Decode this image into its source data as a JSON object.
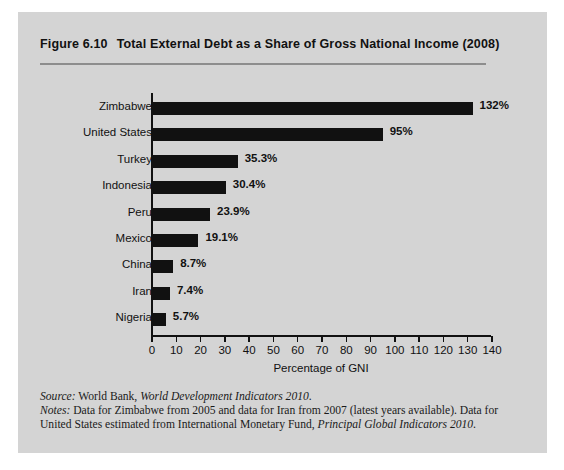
{
  "figure": {
    "number": "Figure 6.10",
    "title": "Total External Debt as a Share of Gross National Income (2008)"
  },
  "chart_data": {
    "type": "bar",
    "orientation": "horizontal",
    "title": "Total External Debt as a Share of Gross National Income (2008)",
    "categories": [
      "Zimbabwe",
      "United States",
      "Turkey",
      "Indonesia",
      "Peru",
      "Mexico",
      "China",
      "Iran",
      "Nigeria"
    ],
    "values": [
      132,
      95,
      35.3,
      30.4,
      23.9,
      19.1,
      8.7,
      7.4,
      5.7
    ],
    "value_labels": [
      "132%",
      "95%",
      "35.3%",
      "30.4%",
      "23.9%",
      "19.1%",
      "8.7%",
      "7.4%",
      "5.7%"
    ],
    "xlabel": "Percentage of GNI",
    "ylabel": "",
    "xlim": [
      0,
      140
    ],
    "xticks": [
      0,
      10,
      20,
      30,
      40,
      50,
      60,
      70,
      80,
      90,
      100,
      110,
      120,
      130,
      140
    ],
    "xtick_labels": [
      "0",
      "10",
      "20",
      "30",
      "40",
      "50",
      "60",
      "70",
      "80",
      "90",
      "100",
      "110",
      "120",
      "130",
      "140"
    ],
    "grid": false,
    "legend": false,
    "bar_color": "#111111",
    "panel_color": "#d4d4d4"
  },
  "footnotes": {
    "source_lead": "Source:",
    "source_text_1": " World Bank, ",
    "source_italic": "World Development Indicators 2010",
    "source_text_2": ".",
    "notes_lead": "Notes:",
    "notes_text_1": " Data for Zimbabwe from 2005 and data for Iran from 2007 (latest years available). Data for United States estimated from International Monetary Fund, ",
    "notes_italic": "Principal Global Indicators 2010",
    "notes_text_2": "."
  }
}
